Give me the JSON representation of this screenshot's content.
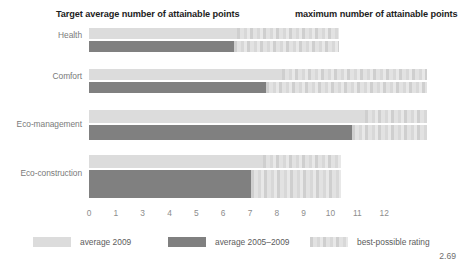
{
  "titles": {
    "left": "Target average number of attainable points",
    "right": "maximum number of attainable points"
  },
  "corner_number": "2.69",
  "legend": {
    "items": [
      {
        "label": "average 2009",
        "style": "light",
        "color": "#dcdcdc"
      },
      {
        "label": "average 2005–2009",
        "style": "dark",
        "color": "#808080"
      },
      {
        "label": "best-possible rating",
        "style": "best",
        "color": "#d5d5d5"
      }
    ]
  },
  "chart_data": {
    "type": "bar",
    "orientation": "horizontal",
    "title": "Target average number of attainable points",
    "subtitle": "maximum number of attainable points",
    "xlabel": "",
    "ylabel": "",
    "xlim": [
      0,
      12
    ],
    "grid": false,
    "legend_position": "bottom",
    "tick_labels": [
      "0",
      "1",
      "3",
      "4",
      "5",
      "6",
      "7",
      "8",
      "9",
      "10",
      "11",
      "12"
    ],
    "tick_values": [
      0,
      1,
      2,
      3,
      4,
      5,
      6,
      7,
      8,
      9,
      10,
      11
    ],
    "categories": [
      "Health",
      "Comfort",
      "Eco-management",
      "Eco-construction"
    ],
    "series": [
      {
        "name": "average 2009",
        "values": [
          5.5,
          7.2,
          10.3,
          6.5
        ]
      },
      {
        "name": "average 2005–2009",
        "values": [
          5.4,
          6.6,
          9.8,
          6.05
        ]
      },
      {
        "name": "best-possible rating",
        "values": [
          9.3,
          12.6,
          12.6,
          9.4
        ]
      }
    ],
    "groups": [
      {
        "category": "Health",
        "bars": [
          {
            "series": "average 2009",
            "value": 5.5,
            "max": 9.3
          },
          {
            "series": "average 2005–2009",
            "value": 5.4,
            "max": 9.3
          }
        ]
      },
      {
        "category": "Comfort",
        "bars": [
          {
            "series": "average 2009",
            "value": 7.2,
            "max": 12.6
          },
          {
            "series": "average 2005–2009",
            "value": 6.6,
            "max": 12.6
          }
        ]
      },
      {
        "category": "Eco-management",
        "bars": [
          {
            "series": "average 2009",
            "value": 10.3,
            "max": 12.6
          },
          {
            "series": "average 2005–2009",
            "value": 9.8,
            "max": 12.6
          }
        ]
      },
      {
        "category": "Eco-construction",
        "bars": [
          {
            "series": "average 2009",
            "value": 6.5,
            "max": 9.4
          },
          {
            "series": "average 2005–2009",
            "value": 6.05,
            "max": 9.4
          }
        ]
      }
    ]
  },
  "layout": {
    "group_tops": [
      0,
      41,
      82,
      127
    ],
    "row_offsets": [
      0,
      13
    ],
    "row_heights": [
      [
        11,
        11
      ],
      [
        11,
        11
      ],
      [
        13,
        15
      ],
      [
        13,
        28
      ]
    ],
    "row_offsets_per_group": [
      [
        0,
        13
      ],
      [
        0,
        13
      ],
      [
        0,
        15
      ],
      [
        0,
        15
      ]
    ],
    "label_tops": [
      2,
      2,
      9,
      13
    ]
  }
}
